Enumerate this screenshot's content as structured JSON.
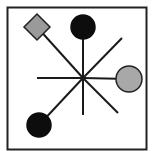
{
  "diagram": {
    "frame": {
      "x": 7.5,
      "y": 7.5,
      "width": 139,
      "height": 142,
      "stroke": "#222222"
    },
    "center": {
      "x": 83,
      "y": 78
    },
    "spoke_color": "#1a1a1a",
    "spokes": [
      {
        "name": "spoke-to-diamond",
        "x2": 37,
        "y2": 27
      },
      {
        "name": "spoke-to-top-circle",
        "x2": 83,
        "y2": 27
      },
      {
        "name": "spoke-northeast",
        "x2": 122,
        "y2": 38
      },
      {
        "name": "spoke-to-right-circle",
        "x2": 129,
        "y2": 79
      },
      {
        "name": "spoke-southeast",
        "x2": 118,
        "y2": 113
      },
      {
        "name": "spoke-south",
        "x2": 83,
        "y2": 115
      },
      {
        "name": "spoke-to-bottom-left-circle",
        "x2": 39,
        "y2": 125
      },
      {
        "name": "spoke-west",
        "x2": 37,
        "y2": 78
      }
    ],
    "nodes": [
      {
        "name": "gray-diamond",
        "shape": "diamond",
        "cx": 37,
        "cy": 27,
        "size": 13,
        "fill": "#9a9a9a",
        "stroke": "#222222"
      },
      {
        "name": "black-circle-top",
        "shape": "circle",
        "cx": 83,
        "cy": 27,
        "r": 12,
        "fill": "#0d0d0d",
        "stroke": "#0d0d0d"
      },
      {
        "name": "gray-circle-right",
        "shape": "circle",
        "cx": 129,
        "cy": 79,
        "r": 13,
        "fill": "#a8a8a8",
        "stroke": "#222222"
      },
      {
        "name": "black-circle-bottom-left",
        "shape": "circle",
        "cx": 39,
        "cy": 125,
        "r": 12,
        "fill": "#0d0d0d",
        "stroke": "#0d0d0d"
      }
    ]
  }
}
